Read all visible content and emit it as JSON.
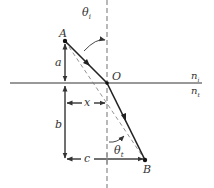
{
  "figure": {
    "points": {
      "A": "A",
      "O": "O",
      "B": "B"
    },
    "media": {
      "incident": {
        "symbol": "n",
        "subscript": "i"
      },
      "transmitted": {
        "symbol": "n",
        "subscript": "t"
      }
    },
    "angles": {
      "incidence": {
        "symbol": "θ",
        "subscript": "i"
      },
      "transmission": {
        "symbol": "θ",
        "subscript": "t"
      }
    },
    "distances": {
      "a": "a",
      "b": "b",
      "x": "x",
      "c": "c"
    },
    "colors": {
      "ray": "#222222",
      "interface": "#333333",
      "normal": "#888888",
      "text": "#333333"
    }
  }
}
